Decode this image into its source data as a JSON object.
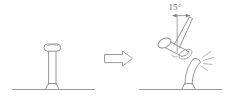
{
  "diagram": {
    "background_color": "#ffffff",
    "line_color": "#8a8a8a",
    "text_color": "#6f6f6f",
    "annotations": {
      "angle_label": "15°",
      "angle_value": 15,
      "angle_unit": "degrees"
    },
    "left_panel": {
      "name": "undeformed-state",
      "object": "vertical cylindrical post standing on ground",
      "post_orientation": "vertical",
      "ground_line": "horizontal"
    },
    "transition": {
      "name": "block-arrow",
      "symbol": "⇒",
      "direction": "right"
    },
    "right_panel": {
      "name": "deformed-state",
      "object": "bent post struck by hammer",
      "post_orientation": "bent to the right",
      "hammer": "cylindrical head with inclined handle",
      "impact_marks": "radiating impact lines at strike point",
      "ground_line": "horizontal"
    }
  }
}
